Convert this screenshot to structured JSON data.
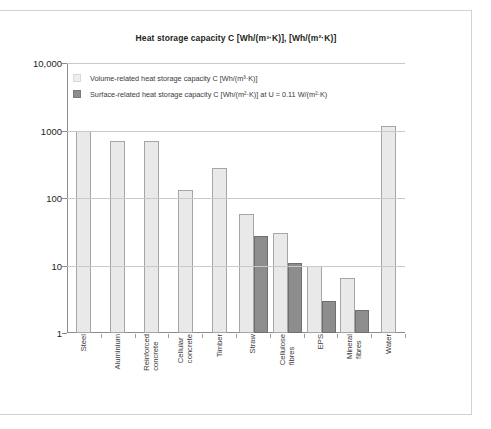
{
  "title": "Heat storage capacity C [Wh/(m³·K)], [Wh/(m²·K)]",
  "legend": [
    {
      "key": "volume",
      "label": "Volume-related heat storage capacity C [Wh/(m³·K)]",
      "color": "#eeeeee"
    },
    {
      "key": "surface",
      "label": "Surface-related heat storage capacity C [Wh/(m²·K)] at U = 0.11 W/(m²·K)",
      "color": "#8d8d8d"
    }
  ],
  "yticks": [
    "10,000",
    "1000",
    "100",
    "10",
    "1"
  ],
  "chart_data": {
    "type": "bar",
    "title": "Heat storage capacity C [Wh/(m³·K)], [Wh/(m²·K)]",
    "xlabel": "",
    "ylabel": "",
    "yscale": "log",
    "ylim": [
      1,
      10000
    ],
    "yticks": [
      1,
      10,
      100,
      1000,
      10000
    ],
    "ytick_labels": [
      "1",
      "10",
      "100",
      "1000",
      "10,000"
    ],
    "grid": true,
    "legend_position": "top-left-inside",
    "categories": [
      "Steel",
      "Aluminium",
      "Reinforced concrete",
      "Cellular concrete",
      "Timber",
      "Straw",
      "Cellulose fibres",
      "EPS",
      "Mineral fibres",
      "Water"
    ],
    "series": [
      {
        "name": "Volume-related heat storage capacity C [Wh/(m³·K)]",
        "color": "#e9e9e9",
        "values": [
          1000,
          700,
          700,
          130,
          280,
          57,
          30,
          10,
          6.5,
          1160
        ]
      },
      {
        "name": "Surface-related heat storage capacity C [Wh/(m²·K)] at U = 0.11 W/(m²·K)",
        "color": "#8d8d8d",
        "values": [
          null,
          null,
          null,
          null,
          null,
          27,
          11,
          3,
          2.2,
          null
        ]
      }
    ]
  }
}
